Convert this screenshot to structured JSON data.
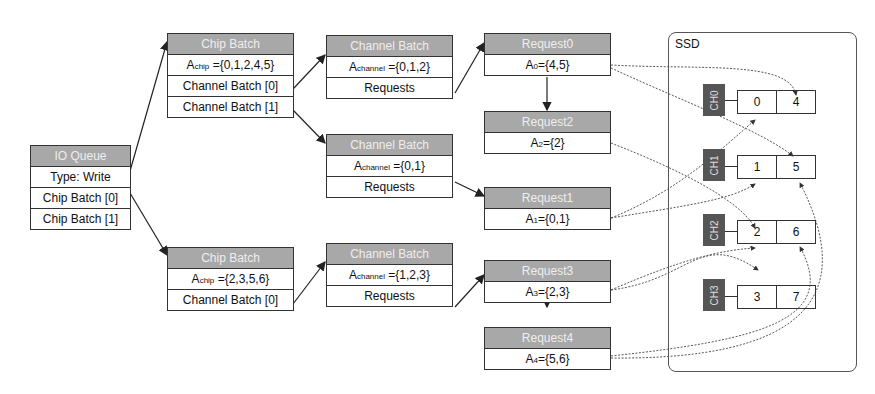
{
  "io_queue": {
    "title": "IO Queue",
    "rows": [
      "Type: Write",
      "Chip Batch [0]",
      "Chip Batch [1]"
    ]
  },
  "chip_batches": [
    {
      "title": "Chip Batch",
      "set_label": "A",
      "set_sub": "chip",
      "set_value": " ={0,1,2,4,5}",
      "rows": [
        "Channel Batch [0]",
        "Channel Batch [1]"
      ]
    },
    {
      "title": "Chip Batch",
      "set_label": "A",
      "set_sub": "chip",
      "set_value": " ={2,3,5,6}",
      "rows": [
        "Channel Batch [0]"
      ]
    }
  ],
  "channel_batches": [
    {
      "title": "Channel Batch",
      "set_label": "A",
      "set_sub": "channel",
      "set_value": " ={0,1,2}",
      "row": "Requests"
    },
    {
      "title": "Channel Batch",
      "set_label": "A",
      "set_sub": "channel",
      "set_value": " ={0,1}",
      "row": "Requests"
    },
    {
      "title": "Channel Batch",
      "set_label": "A",
      "set_sub": "channel",
      "set_value": " ={1,2,3}",
      "row": "Requests"
    }
  ],
  "requests": [
    {
      "title": "Request0",
      "label": "A",
      "sub": "0",
      "value": "={4,5}"
    },
    {
      "title": "Request2",
      "label": "A",
      "sub": "2",
      "value": "={2}"
    },
    {
      "title": "Request1",
      "label": "A",
      "sub": "1",
      "value": "={0,1}"
    },
    {
      "title": "Request3",
      "label": "A",
      "sub": "3",
      "value": "={2,3}"
    },
    {
      "title": "Request4",
      "label": "A",
      "sub": "4",
      "value": "={5,6}"
    }
  ],
  "ssd": {
    "label": "SSD",
    "channels": [
      {
        "name": "CH0",
        "chips": [
          "0",
          "4"
        ]
      },
      {
        "name": "CH1",
        "chips": [
          "1",
          "5"
        ]
      },
      {
        "name": "CH2",
        "chips": [
          "2",
          "6"
        ]
      },
      {
        "name": "CH3",
        "chips": [
          "3",
          "7"
        ]
      }
    ]
  }
}
